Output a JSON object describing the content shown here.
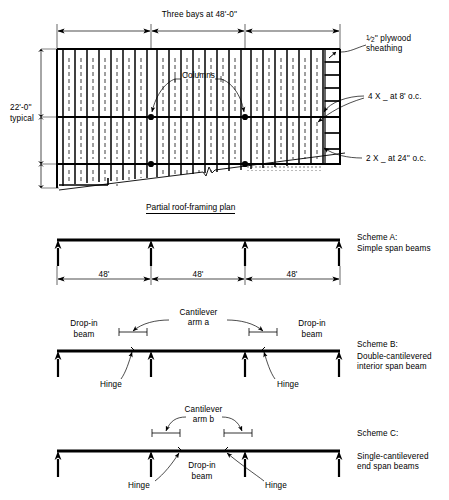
{
  "figure": {
    "title_plan": "Partial roof-framing plan",
    "domain": "structural engineering roof framing diagram"
  },
  "plan": {
    "top_dimension": "Three bays at 48'-0''",
    "left_dimension_line1": "22'-0''",
    "left_dimension_line2": "typical",
    "columns_label": "Columns",
    "sheathing_label_line1_num": "1",
    "sheathing_label_line1_den": "2",
    "sheathing_label_line1_unit": "'' plywood",
    "sheathing_label_line2": "sheathing",
    "purlin_label": "4 X _ at 8' o.c.",
    "joist_label": "2 X _ at 24'' o.c.",
    "bays": 3,
    "bay_width_ft": 48,
    "bay_depth_ft": 22
  },
  "scheme_a": {
    "name": "Scheme A:",
    "description": "Simple span beams",
    "dimensions": [
      "48'",
      "48'",
      "48'"
    ],
    "support_count": 4
  },
  "scheme_b": {
    "name": "Scheme B:",
    "description_line1": "Double-cantilevered",
    "description_line2": "interior span beam",
    "cantilever_label_line1": "Cantilever",
    "cantilever_label_line2": "arm a",
    "dropin_left_line1": "Drop-in",
    "dropin_left_line2": "beam",
    "dropin_right_line1": "Drop-in",
    "dropin_right_line2": "beam",
    "hinge_left": "Hinge",
    "hinge_right": "Hinge",
    "support_count": 4
  },
  "scheme_c": {
    "name": "Scheme C:",
    "description_line1": "Single-cantilevered",
    "description_line2": "end span beams",
    "cantilever_label_line1": "Cantilever",
    "cantilever_label_line2": "arm b",
    "dropin_line1": "Drop-in",
    "dropin_line2": "beam",
    "hinge_left": "Hinge",
    "hinge_right": "Hinge",
    "support_count": 4
  },
  "colors": {
    "ink": "#000000",
    "paper": "#ffffff"
  }
}
